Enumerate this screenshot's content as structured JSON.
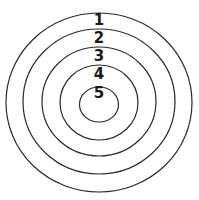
{
  "diagram": {
    "type": "concentric-circles",
    "stroke_color": "#2a2a2a",
    "rings": [
      {
        "label": "1",
        "cx": 99,
        "cy": 102.5,
        "rx": 93,
        "ry": 89.5,
        "label_y": 25
      },
      {
        "label": "2",
        "cx": 99,
        "cy": 101.5,
        "rx": 76,
        "ry": 72.5,
        "label_y": 43
      },
      {
        "label": "3",
        "cx": 99,
        "cy": 101.5,
        "rx": 57,
        "ry": 54.5,
        "label_y": 61
      },
      {
        "label": "4",
        "cx": 99,
        "cy": 102.5,
        "rx": 39,
        "ry": 37.5,
        "label_y": 79
      },
      {
        "label": "5",
        "cx": 99,
        "cy": 104.5,
        "rx": 19.5,
        "ry": 17.5,
        "label_y": 98
      }
    ]
  }
}
